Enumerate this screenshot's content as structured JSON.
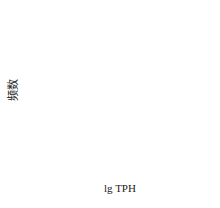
{
  "chart_data": {
    "type": "bar",
    "subtype": "histogram",
    "title": "",
    "xlabel": "lg TPH",
    "ylabel": "频数",
    "x_ticks": [
      "2",
      "3",
      "4",
      "5",
      "6",
      "7"
    ],
    "y_ticks": [
      "0",
      "1",
      "2",
      "3",
      "4",
      "5",
      "6",
      "7",
      "8"
    ],
    "xlim": [
      1.5,
      7.5
    ],
    "ylim": [
      0,
      8
    ],
    "bins": [
      {
        "from": 2.5,
        "to": 3.5,
        "center": 3,
        "count": 4
      },
      {
        "from": 3.5,
        "to": 4.5,
        "center": 4,
        "count": 7
      },
      {
        "from": 4.5,
        "to": 5.5,
        "center": 5,
        "count": 3
      },
      {
        "from": 5.5,
        "to": 6.5,
        "center": 6,
        "count": 3
      }
    ],
    "categories": [
      "3",
      "4",
      "5",
      "6"
    ],
    "values": [
      4,
      7,
      3,
      3
    ],
    "fill": "diagonal hatch",
    "grid": false,
    "legend": null
  },
  "colors": {
    "axis": "#222222",
    "bar_edge": "#222222",
    "hatch": "#555555",
    "background": "#ffffff"
  }
}
